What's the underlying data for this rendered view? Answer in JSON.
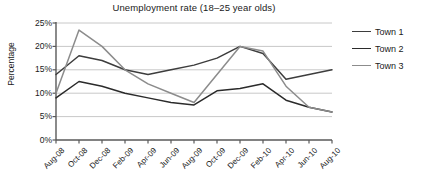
{
  "chart_data": {
    "type": "line",
    "title": "Unemployment rate (18–25 year olds)",
    "xlabel": "",
    "ylabel": "Percentage",
    "categories": [
      "Aug-08",
      "Oct-08",
      "Dec-08",
      "Feb-09",
      "Apr-09",
      "Jun-09",
      "Aug-09",
      "Oct-09",
      "Dec-09",
      "Feb-10",
      "Apr-10",
      "Jun-10",
      "Aug-10"
    ],
    "ylim": [
      0,
      25
    ],
    "ytick_labels": [
      "0%",
      "5%",
      "10%",
      "15%",
      "20%",
      "25%"
    ],
    "ytick_values": [
      0,
      5,
      10,
      15,
      20,
      25
    ],
    "grid": true,
    "legend_position": "right",
    "series": [
      {
        "name": "Town 1",
        "color": "#3d3d3d",
        "values": [
          14,
          18,
          17,
          15,
          14,
          15,
          16,
          17.5,
          20,
          18.5,
          13,
          14,
          15
        ]
      },
      {
        "name": "Town 2",
        "color": "#2b2b2b",
        "values": [
          9,
          12.5,
          11.5,
          10,
          9,
          8,
          7.5,
          10.5,
          11,
          12,
          8.5,
          7,
          6
        ]
      },
      {
        "name": "Town 3",
        "color": "#8c8c8c",
        "values": [
          10,
          23.5,
          20,
          15,
          12,
          10,
          8,
          14,
          20,
          19,
          11.5,
          7,
          6
        ]
      }
    ]
  },
  "axes": {
    "axis_color": "#595959",
    "grid_color": "#c8c8c8",
    "text_color": "#1a1a1a"
  }
}
